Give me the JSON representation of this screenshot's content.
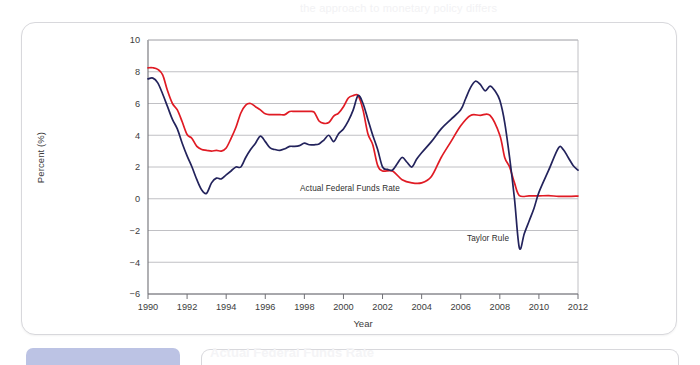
{
  "page": {
    "background_color": "#ffffff",
    "card_border_color": "#d8d8dc",
    "caption_chip_color": "#bcc3e4",
    "ghost_top": "the approach to monetary policy differs",
    "ghost_bottom": "Actual Federal Funds Rate"
  },
  "chart_data": {
    "type": "line",
    "title": "",
    "subtitle": "",
    "xlabel": "Year",
    "ylabel": "Percent (%)",
    "xlim": [
      1990,
      2012
    ],
    "ylim": [
      -6,
      10
    ],
    "xticks": [
      1990,
      1992,
      1994,
      1996,
      1998,
      2000,
      2002,
      2004,
      2006,
      2008,
      2010,
      2012
    ],
    "yticks": [
      -6,
      -4,
      -2,
      0,
      2,
      4,
      6,
      8,
      10
    ],
    "grid": "horizontal",
    "legend_position": "inline-annotations",
    "annotations": [
      {
        "text": "Actual Federal Funds Rate",
        "x": 2000.6,
        "y": 1.05,
        "series": "Actual Federal Funds Rate"
      },
      {
        "text": "Taylor Rule",
        "x": 2008.9,
        "y": -2.15,
        "series": "Taylor Rule"
      }
    ],
    "series": [
      {
        "name": "Actual Federal Funds Rate",
        "color": "#e01b24",
        "x": [
          1990.0,
          1990.25,
          1990.5,
          1990.75,
          1991.0,
          1991.25,
          1991.5,
          1991.75,
          1992.0,
          1992.25,
          1992.5,
          1992.75,
          1993.0,
          1993.25,
          1993.5,
          1993.75,
          1994.0,
          1994.25,
          1994.5,
          1994.75,
          1995.0,
          1995.25,
          1995.5,
          1995.75,
          1996.0,
          1996.25,
          1996.5,
          1996.75,
          1997.0,
          1997.25,
          1997.5,
          1997.75,
          1998.0,
          1998.25,
          1998.5,
          1998.75,
          1999.0,
          1999.25,
          1999.5,
          1999.75,
          2000.0,
          2000.25,
          2000.5,
          2000.75,
          2001.0,
          2001.25,
          2001.5,
          2001.75,
          2002.0,
          2002.5,
          2003.0,
          2003.5,
          2004.0,
          2004.5,
          2005.0,
          2005.5,
          2006.0,
          2006.5,
          2007.0,
          2007.5,
          2008.0,
          2008.25,
          2008.5,
          2008.75,
          2009.0,
          2009.5,
          2010.0,
          2010.5,
          2011.0,
          2011.5,
          2012.0
        ],
        "y": [
          8.25,
          8.25,
          8.15,
          7.8,
          6.8,
          6.0,
          5.6,
          4.85,
          4.05,
          3.8,
          3.3,
          3.1,
          3.05,
          3.0,
          3.05,
          3.0,
          3.2,
          3.8,
          4.5,
          5.4,
          5.9,
          6.0,
          5.8,
          5.6,
          5.35,
          5.3,
          5.3,
          5.3,
          5.3,
          5.5,
          5.5,
          5.5,
          5.5,
          5.5,
          5.45,
          4.9,
          4.75,
          4.8,
          5.2,
          5.4,
          5.8,
          6.35,
          6.5,
          6.5,
          5.6,
          4.1,
          3.4,
          2.1,
          1.75,
          1.75,
          1.2,
          1.0,
          1.0,
          1.4,
          2.6,
          3.6,
          4.6,
          5.25,
          5.25,
          5.25,
          4.0,
          2.6,
          2.0,
          1.0,
          0.2,
          0.18,
          0.18,
          0.2,
          0.15,
          0.15,
          0.17
        ]
      },
      {
        "name": "Taylor Rule",
        "color": "#23235c",
        "x": [
          1990.0,
          1990.25,
          1990.5,
          1990.75,
          1991.0,
          1991.25,
          1991.5,
          1991.75,
          1992.0,
          1992.25,
          1992.5,
          1992.75,
          1993.0,
          1993.25,
          1993.5,
          1993.75,
          1994.0,
          1994.25,
          1994.5,
          1994.75,
          1995.0,
          1995.25,
          1995.5,
          1995.75,
          1996.0,
          1996.25,
          1996.5,
          1996.75,
          1997.0,
          1997.25,
          1997.5,
          1997.75,
          1998.0,
          1998.25,
          1998.5,
          1998.75,
          1999.0,
          1999.25,
          1999.5,
          1999.75,
          2000.0,
          2000.25,
          2000.5,
          2000.75,
          2001.0,
          2001.25,
          2001.5,
          2001.75,
          2002.0,
          2002.25,
          2002.5,
          2002.75,
          2003.0,
          2003.25,
          2003.5,
          2003.75,
          2004.0,
          2004.5,
          2005.0,
          2005.5,
          2006.0,
          2006.25,
          2006.5,
          2006.75,
          2007.0,
          2007.25,
          2007.5,
          2007.75,
          2008.0,
          2008.25,
          2008.5,
          2008.75,
          2009.0,
          2009.25,
          2009.5,
          2009.75,
          2010.0,
          2010.5,
          2011.0,
          2011.25,
          2011.5,
          2011.75,
          2012.0
        ],
        "y": [
          7.55,
          7.6,
          7.3,
          6.6,
          5.8,
          5.0,
          4.4,
          3.5,
          2.7,
          2.0,
          1.2,
          0.55,
          0.35,
          1.0,
          1.3,
          1.25,
          1.5,
          1.75,
          2.0,
          2.0,
          2.6,
          3.1,
          3.5,
          3.95,
          3.6,
          3.2,
          3.1,
          3.05,
          3.15,
          3.3,
          3.3,
          3.35,
          3.5,
          3.4,
          3.4,
          3.45,
          3.7,
          4.0,
          3.6,
          4.1,
          4.4,
          4.9,
          5.6,
          6.5,
          6.0,
          5.0,
          4.0,
          3.1,
          2.0,
          1.85,
          1.8,
          2.2,
          2.6,
          2.3,
          2.0,
          2.5,
          2.9,
          3.6,
          4.4,
          5.0,
          5.6,
          6.3,
          7.0,
          7.4,
          7.2,
          6.8,
          7.1,
          6.8,
          6.2,
          4.8,
          2.6,
          0.0,
          -3.1,
          -2.2,
          -1.4,
          -0.6,
          0.4,
          1.8,
          3.2,
          3.1,
          2.6,
          2.1,
          1.8
        ]
      }
    ]
  },
  "axes": {
    "y_label": "Percent (%)",
    "x_label": "Year"
  }
}
